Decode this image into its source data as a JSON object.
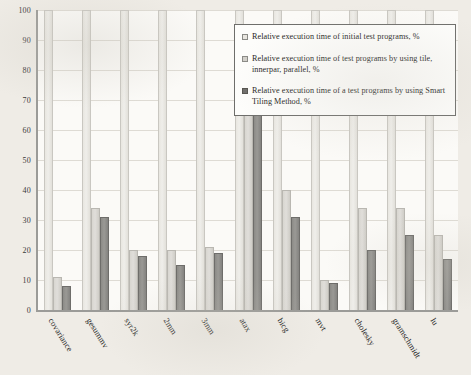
{
  "chart_data": {
    "type": "bar",
    "title": "",
    "xlabel": "",
    "ylabel": "",
    "ylim": [
      0,
      100
    ],
    "yticks": [
      100,
      90,
      80,
      70,
      60,
      50,
      40,
      30,
      20,
      10,
      0
    ],
    "grid": true,
    "legend_position": "top-right-inside",
    "categories": [
      "covariance",
      "gesummv",
      "syr2k",
      "2mm",
      "3mm",
      "atax",
      "bicg",
      "mvt",
      "cholesky",
      "gramschmidt",
      "lu"
    ],
    "series": [
      {
        "name": "Relative execution time of initial test programs, %",
        "color": "#e8e6e0",
        "values": [
          100,
          100,
          100,
          100,
          100,
          100,
          100,
          100,
          100,
          100,
          100
        ]
      },
      {
        "name": "Relative execution time of test programs by using tile, innerpar, parallel, %",
        "color": "#d2d0ca",
        "values": [
          11,
          34,
          20,
          20,
          21,
          82,
          40,
          10,
          34,
          34,
          25
        ]
      },
      {
        "name": "Relative execution time of a test programs by using Smart Tiling Method, %",
        "color": "#6f6e6b",
        "values": [
          8,
          31,
          18,
          15,
          19,
          68,
          31,
          9,
          20,
          25,
          17
        ]
      }
    ]
  },
  "legend": {
    "items": [
      {
        "swatch": "sw1",
        "label": "Relative execution time of initial test programs, %"
      },
      {
        "swatch": "sw2",
        "label": "Relative execution time of test programs by using tile, innerpar, parallel, %"
      },
      {
        "swatch": "sw3",
        "label": "Relative execution time of a test programs by using Smart Tiling Method, %"
      }
    ]
  }
}
